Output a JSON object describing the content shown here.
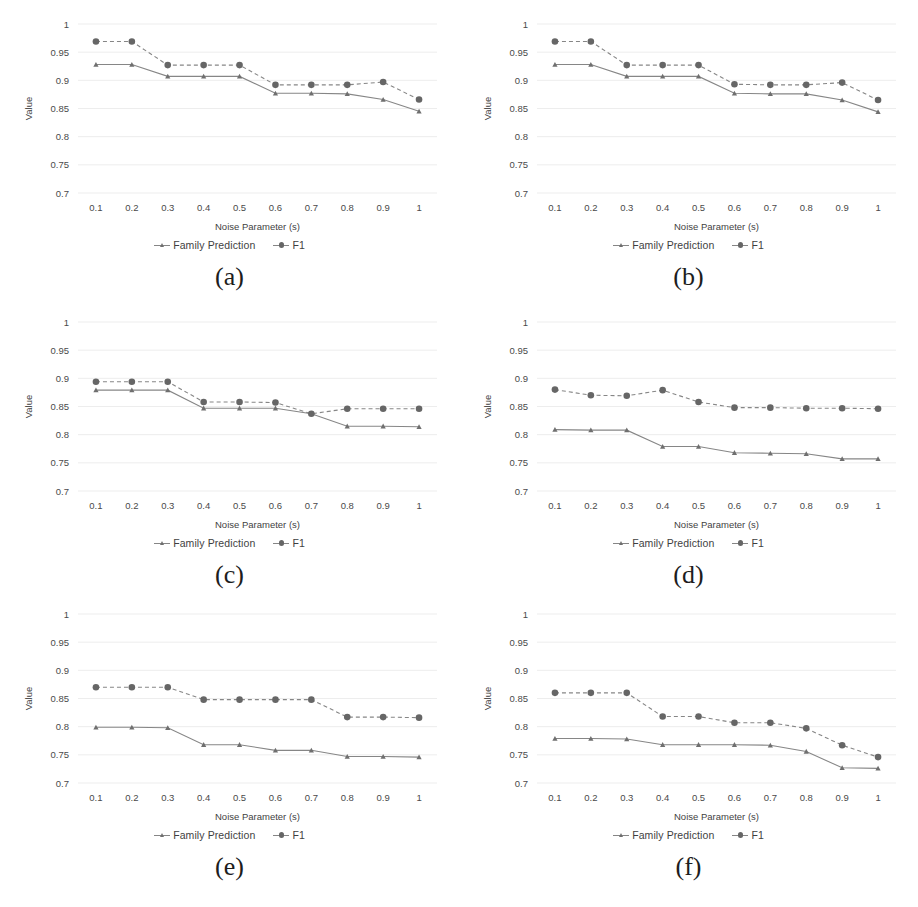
{
  "figure": {
    "panel_order": [
      "a",
      "b",
      "c",
      "d",
      "e",
      "f"
    ],
    "colors": {
      "line": "#868686",
      "marker_f1": "#666666",
      "marker_family": "#6f6f6f",
      "gridline": "#ededed",
      "text": "#3f3f3f",
      "background": "#ffffff"
    },
    "legend": {
      "family_label": "Family Prediction",
      "f1_label": "F1"
    },
    "captions": {
      "a": "(a)",
      "b": "(b)",
      "c": "(c)",
      "d": "(d)",
      "e": "(e)",
      "f": "(f)"
    }
  },
  "chart_data": [
    {
      "id": "a",
      "type": "line",
      "title": "",
      "xlabel": "Noise Parameter (s)",
      "ylabel": "Value",
      "categories": [
        "0.1",
        "0.2",
        "0.3",
        "0.4",
        "0.5",
        "0.6",
        "0.7",
        "0.8",
        "0.9",
        "1"
      ],
      "x": [
        0.1,
        0.2,
        0.3,
        0.4,
        0.5,
        0.6,
        0.7,
        0.8,
        0.9,
        1.0
      ],
      "ylim": [
        0.7,
        1.0
      ],
      "yticks": [
        "0.7",
        "0.75",
        "0.8",
        "0.85",
        "0.9",
        "0.95",
        "1"
      ],
      "grid": true,
      "legend_position": "bottom-center",
      "series": [
        {
          "name": "Family Prediction",
          "style": "solid",
          "marker": "triangle",
          "values": [
            0.928,
            0.928,
            0.907,
            0.907,
            0.907,
            0.877,
            0.877,
            0.876,
            0.866,
            0.845
          ]
        },
        {
          "name": "F1",
          "style": "dashed",
          "marker": "circle",
          "values": [
            0.969,
            0.969,
            0.927,
            0.927,
            0.927,
            0.892,
            0.892,
            0.892,
            0.897,
            0.866
          ]
        }
      ]
    },
    {
      "id": "b",
      "type": "line",
      "title": "",
      "xlabel": "Noise Parameter (s)",
      "ylabel": "Value",
      "categories": [
        "0.1",
        "0.2",
        "0.3",
        "0.4",
        "0.5",
        "0.6",
        "0.7",
        "0.8",
        "0.9",
        "1"
      ],
      "x": [
        0.1,
        0.2,
        0.3,
        0.4,
        0.5,
        0.6,
        0.7,
        0.8,
        0.9,
        1.0
      ],
      "ylim": [
        0.7,
        1.0
      ],
      "yticks": [
        "0.7",
        "0.75",
        "0.8",
        "0.85",
        "0.9",
        "0.95",
        "1"
      ],
      "grid": true,
      "legend_position": "bottom-center",
      "series": [
        {
          "name": "Family Prediction",
          "style": "solid",
          "marker": "triangle",
          "values": [
            0.928,
            0.928,
            0.907,
            0.907,
            0.907,
            0.877,
            0.876,
            0.876,
            0.865,
            0.844
          ]
        },
        {
          "name": "F1",
          "style": "dashed",
          "marker": "circle",
          "values": [
            0.969,
            0.969,
            0.927,
            0.927,
            0.927,
            0.893,
            0.892,
            0.892,
            0.896,
            0.865
          ]
        }
      ]
    },
    {
      "id": "c",
      "type": "line",
      "title": "",
      "xlabel": "Noise Parameter (s)",
      "ylabel": "Value",
      "categories": [
        "0.1",
        "0.2",
        "0.3",
        "0.4",
        "0.5",
        "0.6",
        "0.7",
        "0.8",
        "0.9",
        "1"
      ],
      "x": [
        0.1,
        0.2,
        0.3,
        0.4,
        0.5,
        0.6,
        0.7,
        0.8,
        0.9,
        1.0
      ],
      "ylim": [
        0.7,
        1.0
      ],
      "yticks": [
        "0.7",
        "0.75",
        "0.8",
        "0.85",
        "0.9",
        "0.95",
        "1"
      ],
      "grid": true,
      "legend_position": "bottom-center",
      "series": [
        {
          "name": "Family Prediction",
          "style": "solid",
          "marker": "triangle",
          "values": [
            0.879,
            0.879,
            0.879,
            0.847,
            0.847,
            0.847,
            0.837,
            0.815,
            0.815,
            0.814
          ]
        },
        {
          "name": "F1",
          "style": "dashed",
          "marker": "circle",
          "values": [
            0.894,
            0.894,
            0.894,
            0.858,
            0.858,
            0.857,
            0.837,
            0.846,
            0.846,
            0.846
          ]
        }
      ]
    },
    {
      "id": "d",
      "type": "line",
      "title": "",
      "xlabel": "Noise Parameter (s)",
      "ylabel": "Value",
      "categories": [
        "0.1",
        "0.2",
        "0.3",
        "0.4",
        "0.5",
        "0.6",
        "0.7",
        "0.8",
        "0.9",
        "1"
      ],
      "x": [
        0.1,
        0.2,
        0.3,
        0.4,
        0.5,
        0.6,
        0.7,
        0.8,
        0.9,
        1.0
      ],
      "ylim": [
        0.7,
        1.0
      ],
      "yticks": [
        "0.7",
        "0.75",
        "0.8",
        "0.85",
        "0.9",
        "0.95",
        "1"
      ],
      "grid": true,
      "legend_position": "bottom-center",
      "series": [
        {
          "name": "Family Prediction",
          "style": "solid",
          "marker": "triangle",
          "values": [
            0.809,
            0.808,
            0.808,
            0.779,
            0.779,
            0.768,
            0.767,
            0.766,
            0.757,
            0.757
          ]
        },
        {
          "name": "F1",
          "style": "dashed",
          "marker": "circle",
          "values": [
            0.88,
            0.87,
            0.869,
            0.879,
            0.858,
            0.848,
            0.848,
            0.847,
            0.847,
            0.846
          ]
        }
      ]
    },
    {
      "id": "e",
      "type": "line",
      "title": "",
      "xlabel": "Noise Parameter (s)",
      "ylabel": "Value",
      "categories": [
        "0.1",
        "0.2",
        "0.3",
        "0.4",
        "0.5",
        "0.6",
        "0.7",
        "0.8",
        "0.9",
        "1"
      ],
      "x": [
        0.1,
        0.2,
        0.3,
        0.4,
        0.5,
        0.6,
        0.7,
        0.8,
        0.9,
        1.0
      ],
      "ylim": [
        0.7,
        1.0
      ],
      "yticks": [
        "0.7",
        "0.75",
        "0.8",
        "0.85",
        "0.9",
        "0.95",
        "1"
      ],
      "grid": true,
      "legend_position": "bottom-center",
      "series": [
        {
          "name": "Family Prediction",
          "style": "solid",
          "marker": "triangle",
          "values": [
            0.799,
            0.799,
            0.798,
            0.768,
            0.768,
            0.758,
            0.758,
            0.747,
            0.747,
            0.746
          ]
        },
        {
          "name": "F1",
          "style": "dashed",
          "marker": "circle",
          "values": [
            0.87,
            0.87,
            0.87,
            0.848,
            0.848,
            0.848,
            0.848,
            0.817,
            0.817,
            0.816
          ]
        }
      ]
    },
    {
      "id": "f",
      "type": "line",
      "title": "",
      "xlabel": "Noise Parameter (s)",
      "ylabel": "Value",
      "categories": [
        "0.1",
        "0.2",
        "0.3",
        "0.4",
        "0.5",
        "0.6",
        "0.7",
        "0.8",
        "0.9",
        "1"
      ],
      "x": [
        0.1,
        0.2,
        0.3,
        0.4,
        0.5,
        0.6,
        0.7,
        0.8,
        0.9,
        1.0
      ],
      "ylim": [
        0.7,
        1.0
      ],
      "yticks": [
        "0.7",
        "0.75",
        "0.8",
        "0.85",
        "0.9",
        "0.95",
        "1"
      ],
      "grid": true,
      "legend_position": "bottom-center",
      "series": [
        {
          "name": "Family Prediction",
          "style": "solid",
          "marker": "triangle",
          "values": [
            0.779,
            0.779,
            0.778,
            0.768,
            0.768,
            0.768,
            0.767,
            0.756,
            0.727,
            0.726
          ]
        },
        {
          "name": "F1",
          "style": "dashed",
          "marker": "circle",
          "values": [
            0.86,
            0.86,
            0.86,
            0.818,
            0.818,
            0.807,
            0.807,
            0.797,
            0.767,
            0.746
          ]
        }
      ]
    }
  ]
}
